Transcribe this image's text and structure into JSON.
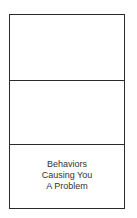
{
  "diagram": {
    "type": "stacked-boxes",
    "cells": [
      {
        "label_lines": []
      },
      {
        "label_lines": []
      },
      {
        "label_lines": [
          "Behaviors",
          "Causing You",
          "A Problem"
        ]
      }
    ]
  }
}
